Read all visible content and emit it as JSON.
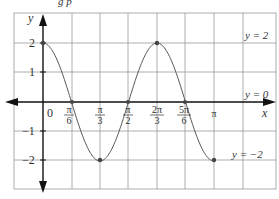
{
  "header": {
    "partial_text": "g p"
  },
  "chart_data": {
    "type": "line",
    "title": "",
    "xlabel": "x",
    "ylabel": "y",
    "function": "y = 2cos(3x)",
    "x": [
      0,
      0.5236,
      1.0472,
      1.5708,
      2.0944,
      2.618,
      3.1416
    ],
    "x_labels": [
      "0",
      "π/6",
      "π/3",
      "π/2",
      "2π/3",
      "5π/6",
      "π"
    ],
    "values": [
      2,
      0,
      -2,
      0,
      2,
      0,
      -2
    ],
    "y_ticks": [
      "2",
      "1",
      "-1",
      "-2"
    ],
    "ylim": [
      -3,
      3
    ],
    "grid": true,
    "annotations": [
      {
        "text": "y = 2",
        "y": 2
      },
      {
        "text": "y = 0",
        "y": 0
      },
      {
        "text": "y = −2",
        "y": -2
      }
    ]
  },
  "labels": {
    "y_axis": "y",
    "x_axis": "x",
    "origin": "0",
    "yt2": "2",
    "yt1": "1",
    "ytm1": "−1",
    "ytm2": "−2",
    "pi": "π",
    "n1": "π",
    "d1": "6",
    "n2": "π",
    "d2": "3",
    "n3": "π",
    "d3": "2",
    "n4": "2π",
    "d4": "3",
    "n5": "5π",
    "d5": "6",
    "ann_top": "y = 2",
    "ann_mid": "y = 0",
    "ann_bot": "y = −2"
  }
}
